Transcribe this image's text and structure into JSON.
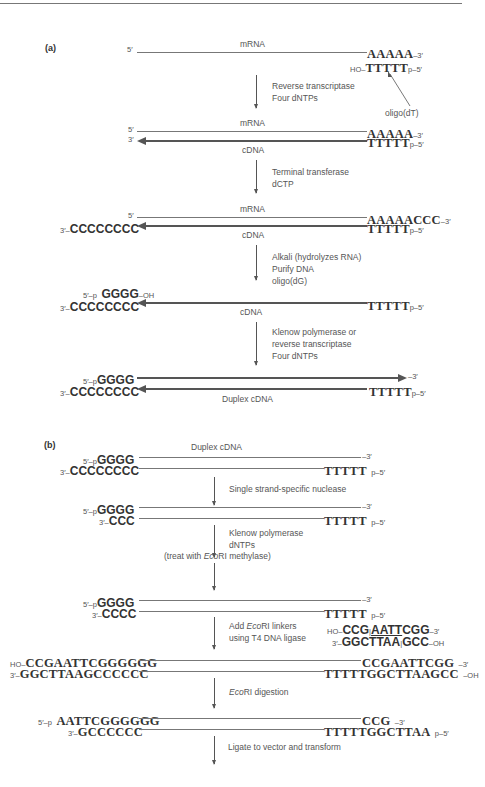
{
  "panel_a": {
    "label": "(a)",
    "row1": {
      "top_left": "5′",
      "strand_label": "mRNA",
      "top_right_seq": "AAAAA",
      "top_right_end": "–3′",
      "bottom_left_end": "HO–",
      "bottom_right_seq": "TTTTT",
      "bottom_right_end": "p–5′",
      "primer_label": "oligo(dT)"
    },
    "step1": [
      "Reverse transcriptase",
      "Four dNTPs"
    ],
    "row2": {
      "top_left": "5′",
      "bottom_left": "3′",
      "top_label": "mRNA",
      "bottom_label": "cDNA",
      "top_right_seq": "AAAAA",
      "top_right_end": "–3′",
      "bottom_right_seq": "TTTTT",
      "bottom_right_end": "p–5′"
    },
    "step2": [
      "Terminal transferase",
      "dCTP"
    ],
    "row3": {
      "top_left": "5′",
      "bottom_left_end": "3′–",
      "bottom_left_seq": "CCCCCCCC",
      "top_label": "mRNA",
      "bottom_label": "cDNA",
      "top_right_seq": "AAAAACCC",
      "top_right_end": "–3′",
      "bottom_right_seq": "TTTTT",
      "bottom_right_end": "p–5′"
    },
    "step3": [
      "Alkali (hydrolyzes RNA)",
      "Purify DNA",
      "oligo(dG)"
    ],
    "row4": {
      "top_left_end": "5′–p",
      "top_left_seq": "GGGG",
      "top_left_tail": "–OH",
      "bottom_left_end": "3′–",
      "bottom_left_seq": "CCCCCCCC",
      "bottom_label": "cDNA",
      "bottom_right_seq": "TTTTT",
      "bottom_right_end": "p–5′"
    },
    "step4": [
      "Klenow polymerase or",
      "reverse transcriptase",
      "Four dNTPs"
    ],
    "row5": {
      "top_left_end": "5′–p",
      "top_left_seq": "GGGG",
      "top_right_end": "–3′",
      "bottom_left_end": "3′–",
      "bottom_left_seq": "CCCCCCCC",
      "bottom_right_seq": "TTTTT",
      "bottom_right_end": "p–5′",
      "label": "Duplex cDNA"
    }
  },
  "panel_b": {
    "label": "(b)",
    "row1": {
      "label": "Duplex cDNA",
      "top_left_end": "5′–p",
      "top_left_seq": "GGGG",
      "top_right_end": "–3′",
      "bottom_left_end": "3′–",
      "bottom_left_seq": "CCCCCCCC",
      "bottom_right_seq": "TTTTT",
      "bottom_right_end": "p–5′"
    },
    "step1": [
      "Single strand-specific nuclease"
    ],
    "row2": {
      "top_left_end": "5′–p",
      "top_left_seq": "GGGG",
      "top_right_end": "–3′",
      "bottom_left_end": "3′–",
      "bottom_left_seq": "CCC",
      "bottom_right_seq": "TTTTT",
      "bottom_right_end": "p–5′"
    },
    "step2": [
      "Klenow polymerase",
      "dNTPs"
    ],
    "step2_note": {
      "prefix": "(treat with ",
      "enzyme": "Eco",
      "enzyme_suffix": "RI",
      "suffix": " methylase)"
    },
    "row3": {
      "top_left_end": "5′–p",
      "top_left_seq": "GGGG",
      "top_right_end": "–3′",
      "bottom_left_end": "3′–",
      "bottom_left_seq": "CCCC",
      "bottom_right_seq": "TTTTT",
      "bottom_right_end": "p–5′"
    },
    "step3": {
      "line1_prefix": "Add ",
      "line1_enzyme": "Eco",
      "line1_enzyme_suffix": "RI",
      "line1_suffix": " linkers",
      "line2": "using T4 DNA ligase"
    },
    "linker": {
      "top_end_left": "HO–",
      "top_seq_a": "CCG",
      "top_sep": "|",
      "top_seq_site": "AATT",
      "top_seq_b": "CGG",
      "top_end_right": "–3′",
      "bottom_end_left": "3′–",
      "bottom_seq_a": "GGCTTAA",
      "bottom_sep": "|",
      "bottom_seq_b": "GCC",
      "bottom_end_right": "–OH"
    },
    "row4": {
      "top_left_end": "HO–",
      "top_left_seq": "CCGAATTCGGGGGG",
      "top_right_seq": "CCGAATTCGG",
      "top_right_end": "–3′",
      "bottom_left_end": "3′–",
      "bottom_left_seq": "GGCTTAAGCCCCCC",
      "bottom_right_seq": "TTTTTGGCTTAAGCC",
      "bottom_right_end": "–OH"
    },
    "step4": {
      "enzyme": "Eco",
      "enzyme_suffix": "RI",
      "suffix": " digestion"
    },
    "row5": {
      "top_left_end": "5′–p",
      "top_left_seq": "AATTCGGGGGG",
      "top_right_seq": "CCG",
      "top_right_end": "–3′",
      "bottom_left_end": "3′–",
      "bottom_left_seq": "GCCCCCC",
      "bottom_right_seq": "TTTTTGGCTTAA",
      "bottom_right_end": "p–5′"
    },
    "step5": [
      "Ligate to vector and transform"
    ]
  }
}
